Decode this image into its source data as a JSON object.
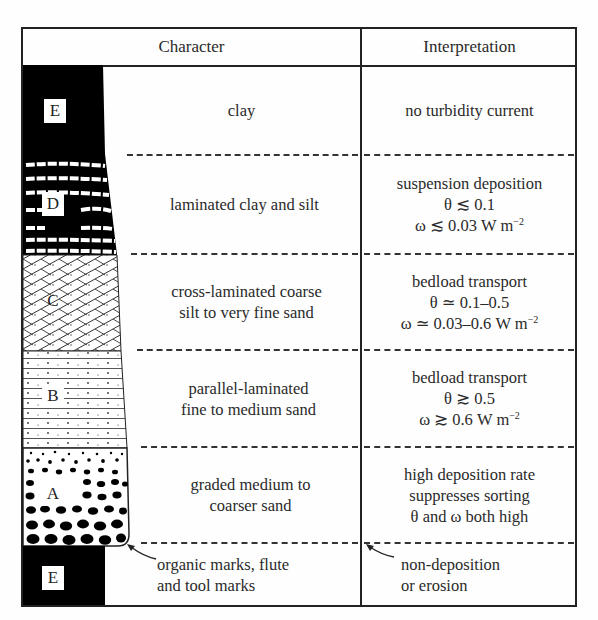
{
  "header": {
    "character": "Character",
    "interpretation": "Interpretation"
  },
  "layers": [
    {
      "label": "E",
      "character": [
        "clay"
      ],
      "interpretation": [
        "no turbidity current"
      ],
      "pattern": "solid-black"
    },
    {
      "label": "D",
      "character": [
        "laminated clay and silt"
      ],
      "interpretation": [
        "suspension deposition",
        "θ ≲ 0.1",
        "ω ≲ 0.03 W m"
      ],
      "omega_exp": "−2",
      "pattern": "black-with-white-laminae"
    },
    {
      "label": "C",
      "character": [
        "cross-laminated coarse",
        "silt to very fine sand"
      ],
      "interpretation": [
        "bedload transport",
        "θ ≃ 0.1–0.5",
        "ω ≃ 0.03–0.6 W m"
      ],
      "omega_exp": "−2",
      "pattern": "cross-hatched"
    },
    {
      "label": "B",
      "character": [
        "parallel-laminated",
        "fine to medium sand"
      ],
      "interpretation": [
        "bedload transport",
        "θ ≳ 0.5",
        "ω ≳ 0.6 W m"
      ],
      "omega_exp": "−2",
      "pattern": "parallel-lines-dotted"
    },
    {
      "label": "A",
      "character": [
        "graded medium to",
        "coarser sand"
      ],
      "interpretation": [
        "high deposition rate",
        "suppresses sorting",
        "θ and ω both high"
      ],
      "pattern": "graded-pebbles"
    },
    {
      "label": "E",
      "character": [
        "organic marks, flute",
        "and tool marks"
      ],
      "interpretation": [
        "non-deposition",
        "or erosion"
      ],
      "pattern": "solid-black"
    }
  ]
}
